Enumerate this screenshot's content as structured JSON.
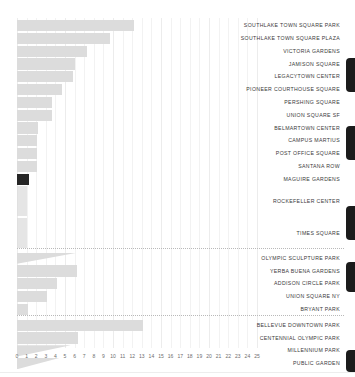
{
  "chart_data": {
    "type": "bar",
    "orientation": "horizontal",
    "title": "",
    "xlabel": "",
    "ylabel": "",
    "xlim": [
      0,
      25
    ],
    "grid": true,
    "legend": "none",
    "bar_color": "#dcdcdc",
    "highlight_color": "#262626",
    "xticks": [
      0,
      1,
      2,
      3,
      4,
      5,
      6,
      7,
      8,
      9,
      10,
      11,
      12,
      13,
      14,
      15,
      16,
      17,
      18,
      19,
      20,
      21,
      22,
      23,
      24,
      25
    ],
    "categories": [
      "SOUTHLAKE TOWN SQUARE PARK",
      "SOUTHLAKE TOWN SQUARE PLAZA",
      "VICTORIA GARDENS",
      "JAMISON SQUARE",
      "LEGACYTOWN CENTER",
      "PIONEER COURTHOUSE SQUARE",
      "PERSHING SQUARE",
      "UNION SQUARE SF",
      "BELMARTOWN CENTER",
      "CAMPUS MARTIUS",
      "POST OFFICE SQUARE",
      "SANTANA ROW",
      "MAGUIRE GARDENS",
      "ROCKEFELLER CENTER",
      "TIMES SQUARE",
      "OLYMPIC SCULPTURE PARK",
      "YERBA BUENA GARDENS",
      "ADDISON CIRCLE PARK",
      "UNION SQUARE NY",
      "BRYANT PARK",
      "BELLEVUE DOWNTOWN PARK",
      "CENTENNIAL OLYMPIC PARK",
      "MILLENNIUM PARK",
      "PUBLIC GARDEN"
    ],
    "values": [
      12.2,
      9.7,
      7.3,
      6.0,
      5.8,
      4.7,
      3.6,
      3.6,
      2.2,
      2.1,
      2.1,
      2.1,
      1.3,
      1.0,
      1.0,
      6.4,
      6.3,
      4.2,
      3.1,
      1.1,
      13.1,
      6.4,
      5.6,
      4.4
    ],
    "highlighted_category": "MAGUIRE GARDENS",
    "annotations": [
      "dotted separator above OLYMPIC SCULPTURE PARK",
      "dotted separator above BELLEVUE DOWNTOWN PARK"
    ]
  }
}
